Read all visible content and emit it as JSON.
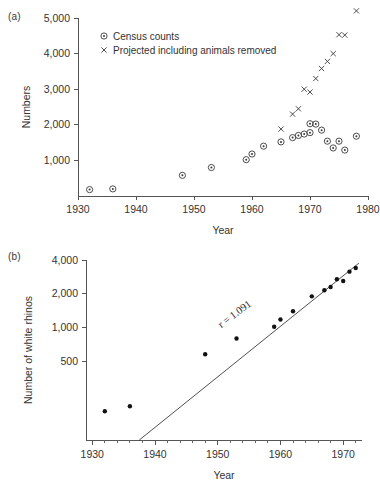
{
  "figure": {
    "panel_a_label": "(a)",
    "panel_b_label": "(b)"
  },
  "chart_data": [
    {
      "type": "scatter",
      "panel": "(a)",
      "title": "",
      "xlabel": "Year",
      "ylabel": "Numbers",
      "xlim": [
        1930,
        1980
      ],
      "ylim": [
        0,
        5000
      ],
      "xticks": [
        1930,
        1940,
        1950,
        1960,
        1970,
        1980
      ],
      "xticklabels": [
        "1930",
        "1940",
        "1950",
        "1960",
        "1970",
        "1980"
      ],
      "yticks": [
        1000,
        2000,
        3000,
        4000,
        5000
      ],
      "yticklabels": [
        "1,000",
        "2,000",
        "3,000",
        "4,000",
        "5,000"
      ],
      "grid": false,
      "yscale": "linear",
      "legend_position": "upper-left-inside",
      "series": [
        {
          "name": "Census counts",
          "marker": "circle-dot",
          "points": [
            {
              "x": 1932,
              "y": 180
            },
            {
              "x": 1936,
              "y": 200
            },
            {
              "x": 1948,
              "y": 580
            },
            {
              "x": 1953,
              "y": 800
            },
            {
              "x": 1959,
              "y": 1020
            },
            {
              "x": 1960,
              "y": 1180
            },
            {
              "x": 1962,
              "y": 1400
            },
            {
              "x": 1965,
              "y": 1520
            },
            {
              "x": 1967,
              "y": 1640
            },
            {
              "x": 1968,
              "y": 1700
            },
            {
              "x": 1969,
              "y": 1740
            },
            {
              "x": 1970,
              "y": 2030
            },
            {
              "x": 1970,
              "y": 1780
            },
            {
              "x": 1971,
              "y": 2020
            },
            {
              "x": 1972,
              "y": 1850
            },
            {
              "x": 1973,
              "y": 1540
            },
            {
              "x": 1974,
              "y": 1350
            },
            {
              "x": 1975,
              "y": 1540
            },
            {
              "x": 1976,
              "y": 1290
            },
            {
              "x": 1978,
              "y": 1680
            }
          ]
        },
        {
          "name": "Projected including animals removed",
          "marker": "x",
          "points": [
            {
              "x": 1965,
              "y": 1880
            },
            {
              "x": 1967,
              "y": 2300
            },
            {
              "x": 1968,
              "y": 2450
            },
            {
              "x": 1969,
              "y": 3000
            },
            {
              "x": 1970,
              "y": 2920
            },
            {
              "x": 1971,
              "y": 3300
            },
            {
              "x": 1972,
              "y": 3580
            },
            {
              "x": 1973,
              "y": 3780
            },
            {
              "x": 1974,
              "y": 4000
            },
            {
              "x": 1975,
              "y": 4530
            },
            {
              "x": 1976,
              "y": 4520
            },
            {
              "x": 1978,
              "y": 5200
            }
          ]
        }
      ],
      "legend": [
        {
          "label": "Census counts",
          "marker": "circle-dot"
        },
        {
          "label": "Projected including animals removed",
          "marker": "x"
        }
      ]
    },
    {
      "type": "scatter",
      "panel": "(b)",
      "title": "",
      "xlabel": "Year",
      "ylabel": "Number of white rhinos",
      "xlim": [
        1929,
        1973
      ],
      "ylim": [
        100,
        4000
      ],
      "yscale": "log",
      "xticks": [
        1930,
        1940,
        1950,
        1960,
        1970
      ],
      "xticklabels": [
        "1930",
        "1940",
        "1950",
        "1960",
        "1970"
      ],
      "xminortick_interval": 2,
      "yticks": [
        500,
        1000,
        2000,
        4000
      ],
      "yticklabels": [
        "500",
        "1,000",
        "2,000",
        "4,000"
      ],
      "grid": false,
      "annotations": [
        {
          "text": "r = 1.091",
          "x": 1953,
          "y": 1250,
          "rotation": -37
        }
      ],
      "fit_line": {
        "label": "r = 1.091",
        "x_start": 1937.5,
        "y_start": 100,
        "x_end": 1972.5,
        "y_end": 3750
      },
      "series": [
        {
          "name": "Number of white rhinos",
          "marker": "filled-circle",
          "points": [
            {
              "x": 1932,
              "y": 180
            },
            {
              "x": 1936,
              "y": 200
            },
            {
              "x": 1948,
              "y": 580
            },
            {
              "x": 1953,
              "y": 800
            },
            {
              "x": 1959,
              "y": 1020
            },
            {
              "x": 1960,
              "y": 1180
            },
            {
              "x": 1962,
              "y": 1400
            },
            {
              "x": 1965,
              "y": 1900
            },
            {
              "x": 1967,
              "y": 2150
            },
            {
              "x": 1968,
              "y": 2300
            },
            {
              "x": 1969,
              "y": 2700
            },
            {
              "x": 1970,
              "y": 2600
            },
            {
              "x": 1971,
              "y": 3150
            },
            {
              "x": 1972,
              "y": 3400
            }
          ]
        }
      ]
    }
  ]
}
